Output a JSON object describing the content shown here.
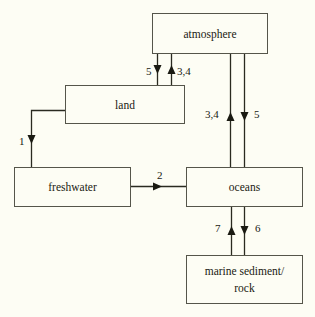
{
  "diagram": {
    "background_color": "#fdfdf4",
    "line_color": "#2a2a20",
    "box_border_color": "#55554a",
    "text_color": "#1a1a12",
    "boxes": [
      {
        "id": "atmosphere",
        "label": "atmosphere",
        "x": 152,
        "y": 13,
        "w": 116,
        "h": 41
      },
      {
        "id": "land",
        "label": "land",
        "x": 65,
        "y": 85,
        "w": 120,
        "h": 39
      },
      {
        "id": "freshwater",
        "label": "freshwater",
        "x": 14,
        "y": 167,
        "w": 117,
        "h": 40
      },
      {
        "id": "oceans",
        "label": "oceans",
        "x": 186,
        "y": 167,
        "w": 117,
        "h": 40
      },
      {
        "id": "marine-sediment",
        "label_line1": "marine sediment/",
        "label_line2": "rock",
        "x": 186,
        "y": 255,
        "w": 117,
        "h": 49
      }
    ],
    "arrows": [
      {
        "id": "atmosphere-to-land",
        "label": "5",
        "from": "atmosphere",
        "to": "land",
        "direction": "down",
        "label_x": 146,
        "label_y": 75
      },
      {
        "id": "land-to-atmosphere",
        "label": "3,4",
        "from": "land",
        "to": "atmosphere",
        "direction": "up",
        "label_x": 177,
        "label_y": 75
      },
      {
        "id": "land-to-freshwater",
        "label": "1",
        "from": "land",
        "to": "freshwater",
        "direction": "down",
        "label_x": 19,
        "label_y": 145
      },
      {
        "id": "freshwater-to-oceans",
        "label": "2",
        "from": "freshwater",
        "to": "oceans",
        "direction": "right",
        "label_x": 157,
        "label_y": 178
      },
      {
        "id": "oceans-to-atmosphere",
        "label": "3,4",
        "from": "oceans",
        "to": "atmosphere",
        "direction": "up",
        "label_x": 207,
        "label_y": 118
      },
      {
        "id": "atmosphere-to-oceans",
        "label": "5",
        "from": "atmosphere",
        "to": "oceans",
        "direction": "down",
        "label_x": 254,
        "label_y": 118
      },
      {
        "id": "marine-sediment-to-oceans",
        "label": "7",
        "from": "marine-sediment",
        "to": "oceans",
        "direction": "up",
        "label_x": 216,
        "label_y": 232
      },
      {
        "id": "oceans-to-marine-sediment",
        "label": "6",
        "from": "oceans",
        "to": "marine-sediment",
        "direction": "down",
        "label_x": 255,
        "label_y": 232
      }
    ]
  }
}
